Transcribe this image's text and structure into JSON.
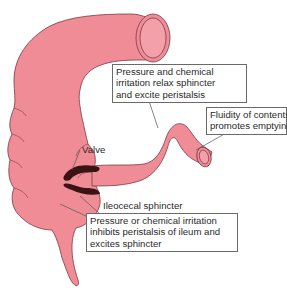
{
  "diagram": {
    "colors": {
      "tissue": "#f08c96",
      "tissue_outline": "#7a3a44",
      "lumen_ring": "#f4a0aa",
      "sphincter": "#3a1414",
      "leader_line": "#555555",
      "box_border": "#6a6a6a",
      "text": "#2a2a2a"
    },
    "labels": {
      "top_box": {
        "lines": [
          "Pressure and chemical",
          "irritation relax sphincter",
          "and excite peristalsis"
        ]
      },
      "right_box": {
        "lines": [
          "Fluidity of contents",
          "promotes emptying"
        ]
      },
      "valve": "Valve",
      "ileocecal": "Ileocecal sphincter",
      "bottom_box": {
        "lines": [
          "Pressure or chemical irritation",
          "inhibits peristalsis of ileum and",
          "excites sphincter"
        ]
      }
    }
  }
}
